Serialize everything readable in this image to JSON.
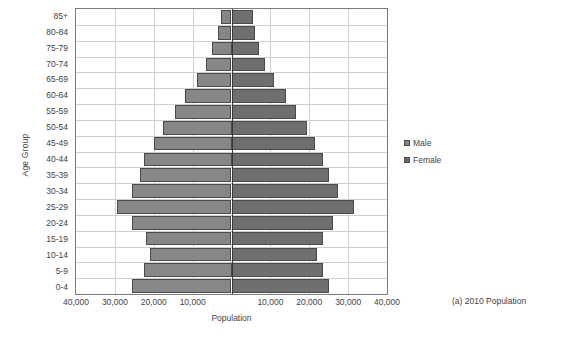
{
  "chart_data": {
    "type": "bar",
    "subtype": "population-pyramid",
    "title": "",
    "caption": "(a)  2010 Population",
    "xlabel": "Population",
    "ylabel": "Age Group",
    "grid": true,
    "legend_position": "right",
    "xlim": [
      -40000,
      40000
    ],
    "xticks": [
      -40000,
      -30000,
      -20000,
      -10000,
      0,
      10000,
      20000,
      30000,
      40000
    ],
    "xtick_labels": [
      "40,000",
      "30,000",
      "20,000",
      "10,000",
      "",
      "10,000",
      "20,000",
      "30,000",
      "40,000"
    ],
    "categories": [
      "0-4",
      "5-9",
      "10-14",
      "15-19",
      "20-24",
      "25-29",
      "30-34",
      "35-39",
      "40-44",
      "45-49",
      "50-54",
      "55-59",
      "60-64",
      "65-69",
      "70-74",
      "75-79",
      "80-84",
      "85+"
    ],
    "series": [
      {
        "name": "Male",
        "color": "#878787",
        "values": [
          25500,
          22500,
          21000,
          22000,
          25500,
          29500,
          25500,
          23500,
          22500,
          20000,
          17500,
          14500,
          12000,
          9000,
          6500,
          5000,
          3500,
          2800
        ]
      },
      {
        "name": "Female",
        "color": "#6f6f6f",
        "values": [
          25000,
          23500,
          22000,
          23500,
          26000,
          31500,
          27500,
          25000,
          23500,
          21500,
          19500,
          16500,
          14000,
          11000,
          8500,
          7000,
          6000,
          5600
        ]
      }
    ]
  },
  "legend": {
    "items": [
      {
        "label": "Male",
        "key": "male"
      },
      {
        "label": "Female",
        "key": "female"
      }
    ]
  }
}
